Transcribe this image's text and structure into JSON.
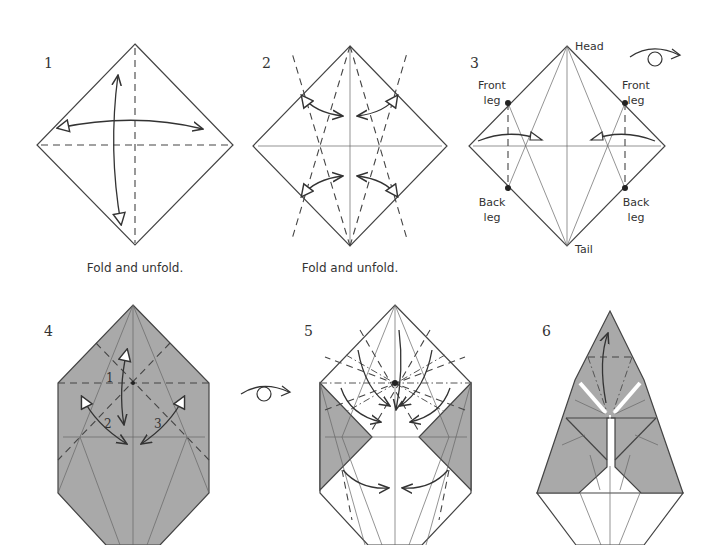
{
  "diagram": {
    "type": "origami-instructions",
    "steps": [
      {
        "number": "1",
        "caption": "Fold and unfold."
      },
      {
        "number": "2",
        "caption": "Fold and unfold."
      },
      {
        "number": "3",
        "caption": "",
        "labels": {
          "head": "Head",
          "tail": "Tail",
          "front_leg_left_1": "Front",
          "front_leg_left_2": "leg",
          "front_leg_right_1": "Front",
          "front_leg_right_2": "leg",
          "back_leg_left_1": "Back",
          "back_leg_left_2": "leg",
          "back_leg_right_1": "Back",
          "back_leg_right_2": "leg"
        }
      },
      {
        "number": "4",
        "caption": "",
        "sub_steps": [
          "1",
          "2",
          "3"
        ]
      },
      {
        "number": "5",
        "caption": ""
      },
      {
        "number": "6",
        "caption": ""
      }
    ],
    "symbols": {
      "turn_over": "turn-over-icon"
    },
    "colors": {
      "paper_shade": "#a9a9a9",
      "line": "#444444",
      "background": "#ffffff"
    }
  }
}
